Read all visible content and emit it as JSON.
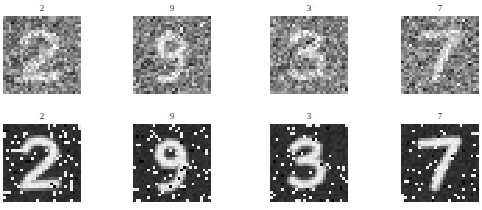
{
  "figure": {
    "background_color": "#ffffff",
    "rows": [
      {
        "row_id": "noisy-gaussian-row",
        "noise_type": "gaussian-speckle",
        "background_color": "#808080",
        "samples": [
          {
            "label": "2",
            "digit": 2
          },
          {
            "label": "9",
            "digit": 9
          },
          {
            "label": "3",
            "digit": 3
          },
          {
            "label": "7",
            "digit": 7
          }
        ]
      },
      {
        "row_id": "noisy-salt-pepper-row",
        "noise_type": "salt-and-pepper",
        "background_color": "#2e2e2e",
        "samples": [
          {
            "label": "2",
            "digit": 2
          },
          {
            "label": "9",
            "digit": 9
          },
          {
            "label": "3",
            "digit": 3
          },
          {
            "label": "7",
            "digit": 7
          }
        ]
      }
    ]
  }
}
